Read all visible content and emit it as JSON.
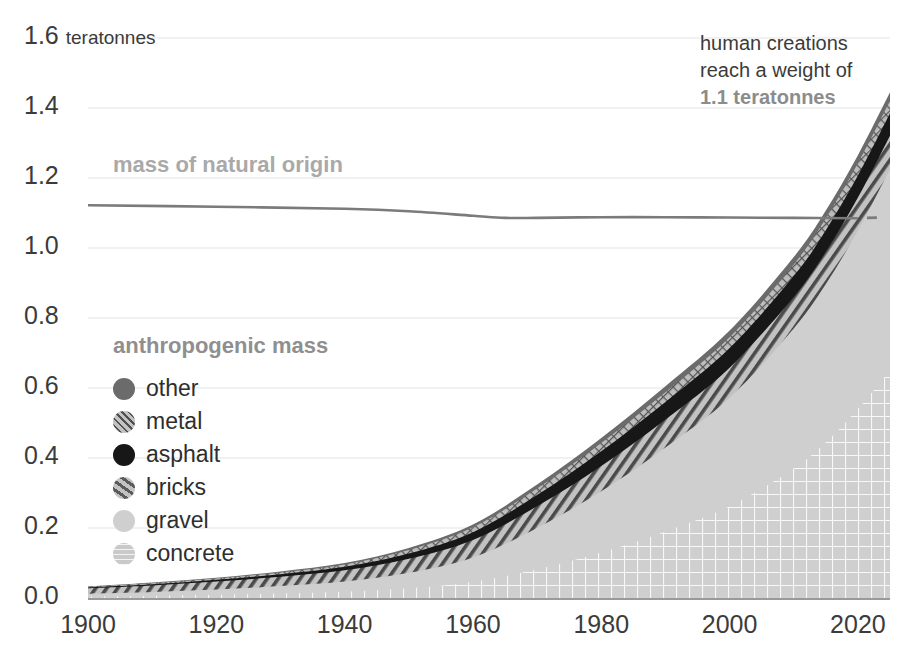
{
  "chart_data": {
    "type": "area",
    "title": "",
    "xlabel": "",
    "ylabel": "teratonnes",
    "unit_label": "teratonnes",
    "xlim": [
      1900,
      2025
    ],
    "ylim": [
      0.0,
      1.6
    ],
    "grid": true,
    "stacked": true,
    "x_ticks": [
      "1900",
      "1920",
      "1940",
      "1960",
      "1980",
      "2000",
      "2020"
    ],
    "x_tick_values": [
      1900,
      1920,
      1940,
      1960,
      1980,
      2000,
      2020
    ],
    "y_ticks": [
      "0.0",
      "0.2",
      "0.4",
      "0.6",
      "0.8",
      "1.0",
      "1.2",
      "1.4",
      "1.6"
    ],
    "y_tick_values": [
      0.0,
      0.2,
      0.4,
      0.6,
      0.8,
      1.0,
      1.2,
      1.4,
      1.6
    ],
    "x": [
      1900,
      1910,
      1920,
      1930,
      1940,
      1950,
      1960,
      1970,
      1980,
      1990,
      2000,
      2010,
      2015,
      2020,
      2025
    ],
    "series": [
      {
        "name": "concrete",
        "pattern": "grid",
        "color": "#c9c9c9",
        "values": [
          0.004,
          0.006,
          0.009,
          0.013,
          0.018,
          0.028,
          0.046,
          0.082,
          0.13,
          0.19,
          0.262,
          0.37,
          0.445,
          0.54,
          0.65
        ]
      },
      {
        "name": "gravel",
        "pattern": "solid",
        "color": "#cfcfcf",
        "values": [
          0.008,
          0.011,
          0.015,
          0.021,
          0.029,
          0.044,
          0.07,
          0.118,
          0.175,
          0.24,
          0.31,
          0.4,
          0.452,
          0.51,
          0.575
        ]
      },
      {
        "name": "bricks",
        "pattern": "diagonal-hatch",
        "color": "#b4b4b4",
        "values": [
          0.016,
          0.019,
          0.023,
          0.027,
          0.032,
          0.04,
          0.05,
          0.062,
          0.072,
          0.08,
          0.086,
          0.09,
          0.092,
          0.094,
          0.096
        ]
      },
      {
        "name": "asphalt",
        "pattern": "solid",
        "color": "#171717",
        "values": [
          0.002,
          0.003,
          0.005,
          0.007,
          0.01,
          0.015,
          0.022,
          0.032,
          0.042,
          0.05,
          0.056,
          0.06,
          0.062,
          0.063,
          0.064
        ]
      },
      {
        "name": "metal",
        "pattern": "crosshatch",
        "color": "#6f6f6f",
        "values": [
          0.002,
          0.003,
          0.004,
          0.005,
          0.007,
          0.01,
          0.014,
          0.019,
          0.024,
          0.028,
          0.031,
          0.033,
          0.034,
          0.035,
          0.036
        ]
      },
      {
        "name": "other",
        "pattern": "solid",
        "color": "#6b6b6b",
        "values": [
          0.001,
          0.002,
          0.002,
          0.003,
          0.004,
          0.006,
          0.008,
          0.011,
          0.014,
          0.017,
          0.019,
          0.021,
          0.022,
          0.023,
          0.024
        ]
      }
    ],
    "reference_line": {
      "name": "mass of natural origin",
      "color": "#7b7b7b",
      "x": [
        1900,
        1920,
        1940,
        1950,
        1960,
        1965,
        1970,
        1980,
        1990,
        2000,
        2010,
        2020
      ],
      "values": [
        1.122,
        1.118,
        1.112,
        1.105,
        1.092,
        1.086,
        1.086,
        1.088,
        1.088,
        1.087,
        1.086,
        1.085
      ]
    },
    "legend_position": "inside-left",
    "legend_title": "anthropogenic mass",
    "legend_entries": [
      "other",
      "metal",
      "asphalt",
      "bricks",
      "gravel",
      "concrete"
    ]
  },
  "labels": {
    "unit": "teratonnes",
    "natural_series": "mass of natural origin",
    "anthropogenic_heading": "anthropogenic mass"
  },
  "annotation": {
    "line1": "human creations",
    "line2": "reach a weight of",
    "line3": "1.1 teratonnes"
  },
  "legend": {
    "items": [
      {
        "label": "other"
      },
      {
        "label": "metal"
      },
      {
        "label": "asphalt"
      },
      {
        "label": "bricks"
      },
      {
        "label": "gravel"
      },
      {
        "label": "concrete"
      }
    ]
  },
  "colors": {
    "concrete": "#c9c9c9",
    "gravel": "#cfcfcf",
    "bricks": "#b4b4b4",
    "asphalt": "#171717",
    "metal": "#6f6f6f",
    "other": "#6b6b6b",
    "natural_line": "#7b7b7b",
    "grid": "#ededed",
    "text": "#3b3b3b"
  }
}
